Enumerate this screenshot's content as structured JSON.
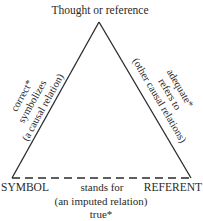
{
  "diagram": {
    "type": "semiotic-triangle",
    "apex_label": "Thought or reference",
    "left_corner_label": "SYMBOL",
    "right_corner_label": "REFERENT",
    "left_side": {
      "line1": "correct*",
      "line2": "symbolizes",
      "line3": "(a causal relation)"
    },
    "right_side": {
      "line1": "adequate*",
      "line2": "refers to",
      "line3": "(other causal relations)"
    },
    "base": {
      "line1": "stands for",
      "line2": "(an imputed relation)",
      "line3": "true*"
    },
    "colors": {
      "line": "#2a2a2a",
      "text": "#2a2a2a",
      "background": "#ffffff"
    }
  }
}
